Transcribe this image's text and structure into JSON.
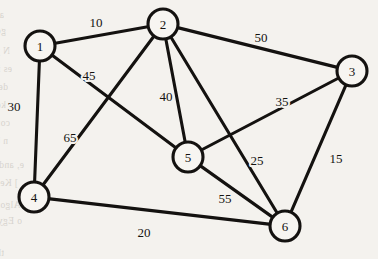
{
  "figure": {
    "kind": "weighted-undirected-graph",
    "background_color": "#f4f2ee",
    "ink_color": "#141210",
    "node_fill_color": "#f7f5f1",
    "node_radius": 15
  },
  "nodes": [
    {
      "id": "1",
      "label": "1",
      "x": 40,
      "y": 46
    },
    {
      "id": "2",
      "label": "2",
      "x": 163,
      "y": 24
    },
    {
      "id": "3",
      "label": "3",
      "x": 352,
      "y": 71
    },
    {
      "id": "4",
      "label": "4",
      "x": 34,
      "y": 197
    },
    {
      "id": "5",
      "label": "5",
      "x": 188,
      "y": 157
    },
    {
      "id": "6",
      "label": "6",
      "x": 285,
      "y": 226
    }
  ],
  "edges": [
    {
      "id": "e-1-2",
      "from": "1",
      "to": "2",
      "weight": "10",
      "label_x": 96,
      "label_y": 22
    },
    {
      "id": "e-2-3",
      "from": "2",
      "to": "3",
      "weight": "50",
      "label_x": 261,
      "label_y": 37
    },
    {
      "id": "e-1-4",
      "from": "1",
      "to": "4",
      "weight": "30",
      "label_x": 14,
      "label_y": 106
    },
    {
      "id": "e-1-5",
      "from": "1",
      "to": "5",
      "weight": "45",
      "label_x": 89,
      "label_y": 75
    },
    {
      "id": "e-2-4",
      "from": "2",
      "to": "4",
      "weight": "65",
      "label_x": 70,
      "label_y": 137
    },
    {
      "id": "e-2-5",
      "from": "2",
      "to": "5",
      "weight": "40",
      "label_x": 166,
      "label_y": 96
    },
    {
      "id": "e-2-6",
      "from": "2",
      "to": "6",
      "weight": "25",
      "label_x": 257,
      "label_y": 160
    },
    {
      "id": "e-3-5",
      "from": "3",
      "to": "5",
      "weight": "35",
      "label_x": 282,
      "label_y": 101
    },
    {
      "id": "e-3-6",
      "from": "3",
      "to": "6",
      "weight": "15",
      "label_x": 336,
      "label_y": 158
    },
    {
      "id": "e-4-6",
      "from": "4",
      "to": "6",
      "weight": "20",
      "label_x": 144,
      "label_y": 232
    },
    {
      "id": "e-5-6",
      "from": "5",
      "to": "6",
      "weight": "55",
      "label_x": 225,
      "label_y": 198
    }
  ],
  "chart_data": {
    "type": "graph",
    "title": "",
    "nodes": [
      "1",
      "2",
      "3",
      "4",
      "5",
      "6"
    ],
    "edges": [
      {
        "source": "1",
        "target": "2",
        "weight": 10
      },
      {
        "source": "1",
        "target": "4",
        "weight": 30
      },
      {
        "source": "1",
        "target": "5",
        "weight": 45
      },
      {
        "source": "2",
        "target": "3",
        "weight": 50
      },
      {
        "source": "2",
        "target": "4",
        "weight": 65
      },
      {
        "source": "2",
        "target": "5",
        "weight": 40
      },
      {
        "source": "2",
        "target": "6",
        "weight": 25
      },
      {
        "source": "3",
        "target": "5",
        "weight": 35
      },
      {
        "source": "3",
        "target": "6",
        "weight": 15
      },
      {
        "source": "4",
        "target": "6",
        "weight": 20
      },
      {
        "source": "5",
        "target": "6",
        "weight": 55
      }
    ],
    "directed": false,
    "weighted": true
  },
  "background_bleed_lines": [
    {
      "text": "as a G t o a point, as Otto is a function.  Q own table on Ch",
      "x": 4,
      "y": 10
    },
    {
      "text": "gorm Xtigher   Sig nature   on   nection  y solves",
      "x": 6,
      "y": 26
    },
    {
      "text": "N y  at   a  A'  ~  then  z  the  fraction  by  a  point  seen  you  in  a  graph",
      "x": 10,
      "y": 46
    },
    {
      "text": "es  in  computing  and  a  dense  the  er   Int  is  a  ma  x  is  a  domain",
      "x": 12,
      "y": 64
    },
    {
      "text": "der  easy   approach.    Im  beginning  with  the   Y   in   Ou  a  vert  n",
      "x": 8,
      "y": 82
    },
    {
      "text": "keeps  Mention  to  a  tex  or  the  language  of  n  g  o  t  set  re  C  s  Hal  t  h",
      "x": 6,
      "y": 100
    },
    {
      "text": "convenently  the  gr  a  v  erestics  for  stibution  N)  e  r   could  it  t  a  n  the",
      "x": 10,
      "y": 118
    },
    {
      "text": "n  between  the  a  b  and  using  prob  e  t   is   a  ui  r  of  a",
      "x": 8,
      "y": 136
    },
    {
      "text": "e,   and   She   is   in   for   in   by   m   answer   Common   a   pro",
      "x": 24,
      "y": 160
    },
    {
      "text": "]   Kem   one   a   T   of   Key   l   on   to   ic   foring     ad",
      "x": 18,
      "y": 178
    },
    {
      "text": "is  Algorithms  Var  On  s  of  ng  aome",
      "x": 30,
      "y": 200
    },
    {
      "text": "o  Egy  Grab  G  a  s  nes  e  Chof  ode  y  wh  if  e  s  v  ta  age  e",
      "x": 22,
      "y": 216
    },
    {
      "text": "thi,  ainq,  koptte  ttelt  tecson  Obtr  t  this  j  e  no  sit  r  t  o  f  pige  we  n  se",
      "x": 4,
      "y": 248
    }
  ]
}
